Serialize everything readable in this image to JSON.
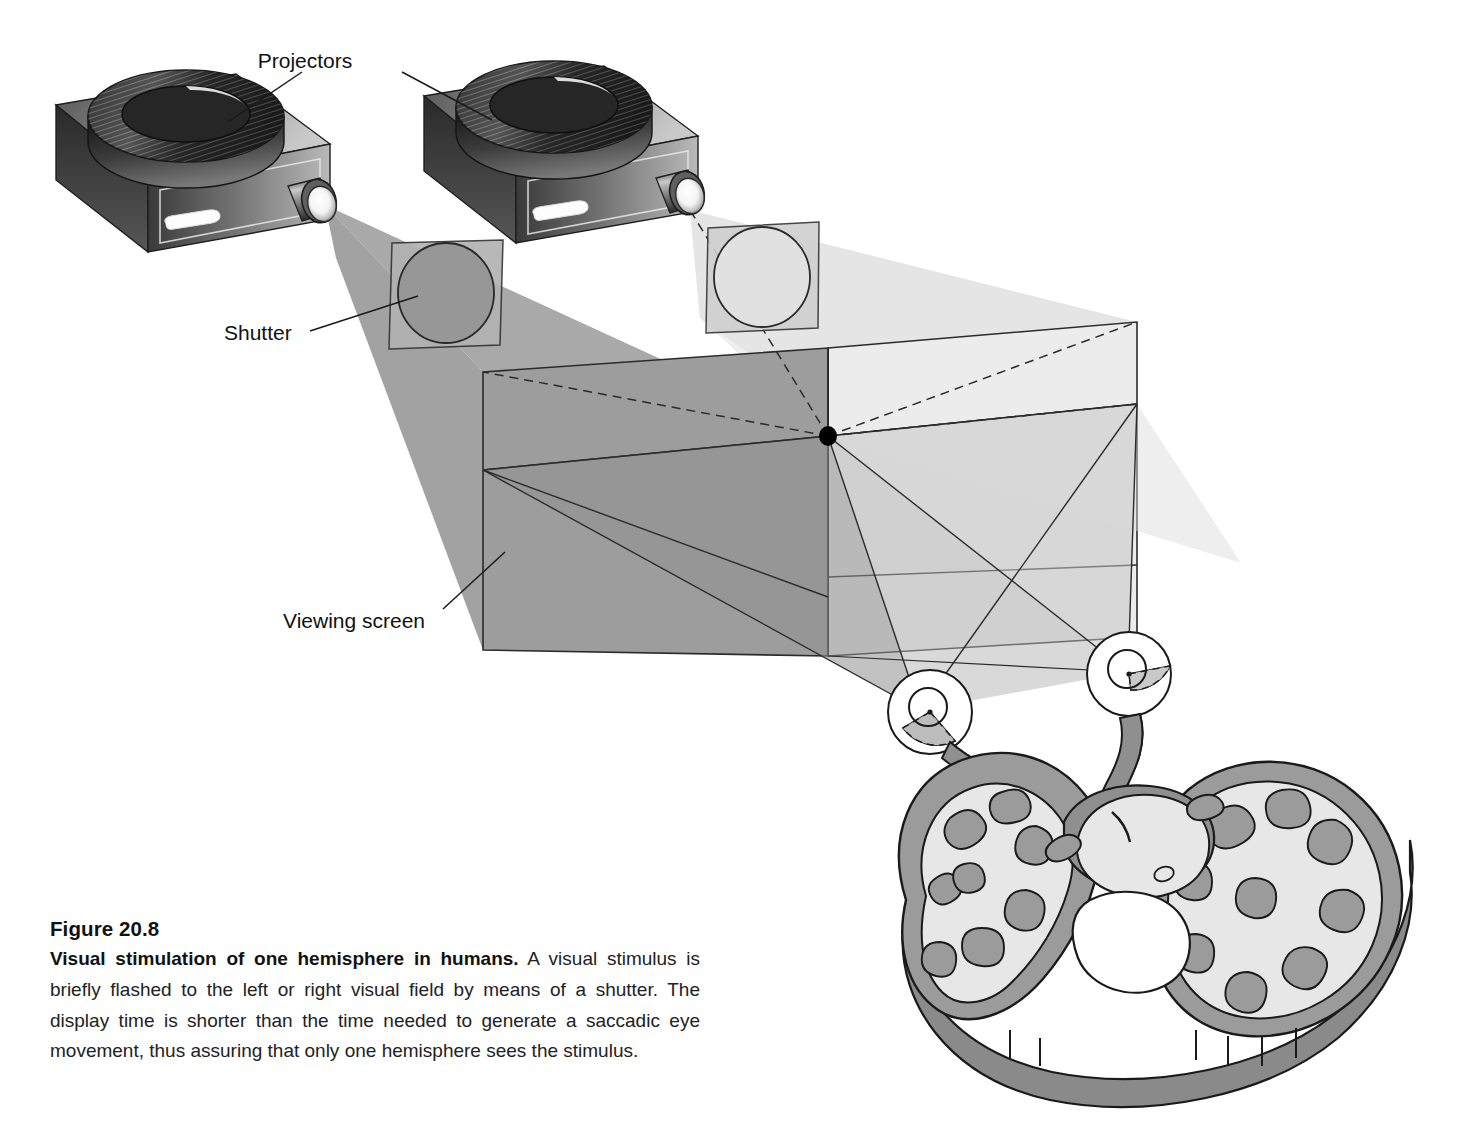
{
  "figure": {
    "number_label": "Figure 20.8",
    "title": "Visual stimulation of one hemisphere in humans.",
    "body": " A visual stimulus is briefly flashed to the left or right visual field by means of a shutter. The display time is shorter than the time needed to generate a saccadic eye movement, thus assuring that only one hemisphere sees the stimulus."
  },
  "labels": {
    "projectors": "Projectors",
    "shutter": "Shutter",
    "viewing_screen": "Viewing screen"
  },
  "parts": {
    "projector_left": "projector-left",
    "projector_right": "projector-right",
    "shutter_left": "shutter-left-closed",
    "shutter_right": "shutter-right-open",
    "screen_left_panel": "viewing-screen-left-panel",
    "screen_right_panel": "viewing-screen-right-panel",
    "fixation_point": "fixation-point",
    "eye_left": "eye-left",
    "eye_right": "eye-right",
    "optic_nerve_left": "optic-nerve-left",
    "optic_nerve_right": "optic-nerve-right",
    "optic_chiasm": "optic-chiasm",
    "brain": "brain-horizontal-section",
    "hemisphere_left": "left-hemisphere",
    "hemisphere_right": "right-hemisphere",
    "corpus_callosum": "corpus-callosum",
    "thalamus": "thalamus"
  },
  "colors": {
    "background": "#ffffff",
    "ink": "#1a1a1a",
    "beam_dark": "#9a9a9a",
    "beam_light": "#e4e4e4",
    "screen_dark": "#9d9d9d",
    "screen_light": "#ececec",
    "screen_overlap": "#8f8f8f",
    "shutter_closed_panel": "#b2b2b2",
    "shutter_closed_aperture": "#969696",
    "shutter_open_panel": "#cfcfcf",
    "shutter_open_aperture": "#e0e0e0",
    "projector_body_dark": "#2e2e2e",
    "projector_body_mid": "#6f6f6f",
    "projector_body_light": "#b8b8b8",
    "reel_dark": "#1c1c1c",
    "lens_glow": "#ffffff",
    "brain_gray_matter": "#9b9b9b",
    "brain_white_matter": "#e3e3e3",
    "brain_edge": "#1a1a1a",
    "fixation_dot": "#000000"
  }
}
